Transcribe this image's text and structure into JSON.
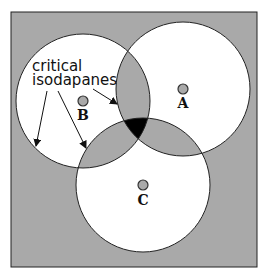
{
  "diagram": {
    "title": "Critical isodapanes",
    "annotation": {
      "line1": "critical",
      "line2": "isodapanes"
    },
    "colors": {
      "background": "#a9a9a9",
      "circle_fill": "#ffffff",
      "overlap_two": "#a9a9a9",
      "overlap_three": "#000000",
      "stroke": "#222222",
      "point_fill": "#a9a9a9"
    },
    "points": [
      {
        "id": "A",
        "label": "A",
        "cx": 183,
        "cy": 89,
        "isodapane_radius": 67
      },
      {
        "id": "B",
        "label": "B",
        "cx": 83,
        "cy": 101,
        "isodapane_radius": 67
      },
      {
        "id": "C",
        "label": "C",
        "cx": 143,
        "cy": 185,
        "isodapane_radius": 67
      }
    ],
    "arrows": [
      {
        "from": [
          47,
          91
        ],
        "to": [
          36,
          146
        ]
      },
      {
        "from": [
          58,
          91
        ],
        "to": [
          86,
          148
        ]
      },
      {
        "from": [
          93,
          89
        ],
        "to": [
          117,
          104
        ]
      }
    ]
  }
}
